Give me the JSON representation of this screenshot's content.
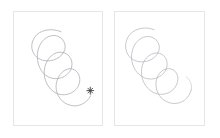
{
  "canvas": {
    "width": 220,
    "height": 138,
    "background_color": "#ffffff",
    "layout": "two-panel-side-by-side"
  },
  "style": {
    "panel_border_color": "#e6e6ea",
    "panel_background_color": "#ffffff",
    "sketch_stroke_color": "#a3a3ab",
    "sketch_stroke_color_light": "#b8b8c0",
    "marker_color": "#3a3a3a"
  },
  "panels": [
    {
      "id": "panel-left",
      "position": "left",
      "caption": "",
      "x": 13,
      "y": 11,
      "width": 90,
      "height": 115,
      "drawing": {
        "name": "descending-spiral-sketch",
        "kind": "hand-drawn-coil",
        "loop_count": 3,
        "direction": "top-left-to-bottom-right",
        "stroke_color": "#a3a3ab",
        "stroke_width": 0.7,
        "has_end_marker": true,
        "end_marker": {
          "name": "asterisk-marker",
          "glyph": "asterisk",
          "x": 78,
          "y": 80,
          "color": "#3a3a3a"
        }
      }
    },
    {
      "id": "panel-right",
      "position": "right",
      "caption": "",
      "x": 114,
      "y": 11,
      "width": 91,
      "height": 115,
      "drawing": {
        "name": "descending-spiral-sketch",
        "kind": "hand-drawn-coil",
        "loop_count": 3,
        "direction": "top-left-to-bottom-right",
        "stroke_color": "#b0b0b8",
        "stroke_width": 0.7,
        "has_end_marker": false,
        "end_marker": null
      }
    }
  ]
}
